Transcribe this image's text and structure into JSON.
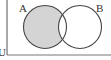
{
  "diagram": {
    "type": "venn",
    "universe_label": "U",
    "sets": [
      {
        "label": "A",
        "shaded": true
      },
      {
        "label": "B",
        "shaded": false
      }
    ],
    "shaded_region": "A only (A minus B)",
    "colors": {
      "shade": "#d4d4d4",
      "stroke": "#444444",
      "background": "#ffffff"
    }
  }
}
